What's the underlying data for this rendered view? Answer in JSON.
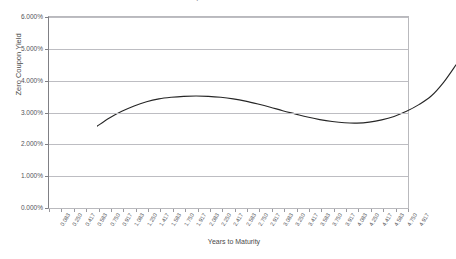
{
  "chart_data": {
    "type": "line",
    "title": "Zero Coupon Yield Curve",
    "xlabel": "Years to Maturity",
    "ylabel": "Zero Coupon Yield",
    "ylim": [
      0,
      6
    ],
    "ytick_labels": [
      "6.000%",
      "5.000%",
      "4.000%",
      "3.000%",
      "2.000%",
      "1.000%",
      "0.000%"
    ],
    "ytick_values": [
      6,
      5,
      4,
      3,
      2,
      1,
      0
    ],
    "xlim": [
      0.083,
      4.917
    ],
    "grid": "horizontal",
    "legend": "none",
    "line_color": "#262626",
    "x": [
      0.083,
      0.25,
      0.417,
      0.583,
      0.75,
      0.917,
      1.083,
      1.25,
      1.417,
      1.583,
      1.75,
      1.917,
      2.083,
      2.25,
      2.417,
      2.583,
      2.75,
      2.917,
      3.083,
      3.25,
      3.417,
      3.583,
      3.75,
      3.917,
      4.083,
      4.25,
      4.417,
      4.583,
      4.75,
      4.917
    ],
    "categories": [
      "0.083",
      "0.250",
      "0.417",
      "0.583",
      "0.750",
      "0.917",
      "1.083",
      "1.250",
      "1.417",
      "1.583",
      "1.750",
      "1.917",
      "2.083",
      "2.250",
      "2.417",
      "2.583",
      "2.750",
      "2.917",
      "3.083",
      "3.250",
      "3.417",
      "3.583",
      "3.750",
      "3.917",
      "4.083",
      "4.250",
      "4.417",
      "4.583",
      "4.750",
      "4.917"
    ],
    "values": [
      3.07,
      3.33,
      3.54,
      3.71,
      3.84,
      3.93,
      3.98,
      4.01,
      4.02,
      4.01,
      3.98,
      3.93,
      3.86,
      3.77,
      3.67,
      3.56,
      3.46,
      3.36,
      3.28,
      3.22,
      3.18,
      3.17,
      3.2,
      3.27,
      3.38,
      3.54,
      3.75,
      4.02,
      4.45,
      5.0
    ]
  }
}
